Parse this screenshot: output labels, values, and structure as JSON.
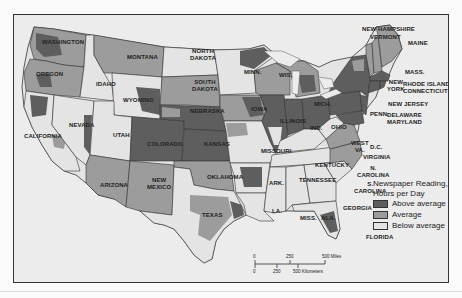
{
  "map": {
    "subject": "Newspaper reading in the United States",
    "states": [
      {
        "name": "WASHINGTON",
        "shade": "mixed"
      },
      {
        "name": "OREGON",
        "shade": "mixed"
      },
      {
        "name": "CALIFORNIA",
        "shade": "mixed"
      },
      {
        "name": "IDAHO",
        "shade": "below"
      },
      {
        "name": "NEVADA",
        "shade": "below"
      },
      {
        "name": "MONTANA",
        "shade": "average"
      },
      {
        "name": "WYOMING",
        "shade": "mixed"
      },
      {
        "name": "UTAH",
        "shade": "below"
      },
      {
        "name": "ARIZONA",
        "shade": "average"
      },
      {
        "name": "COLORADO",
        "shade": "above"
      },
      {
        "name": "NEW MEXICO",
        "shade": "average"
      },
      {
        "name": "NORTH DAKOTA",
        "shade": "below"
      },
      {
        "name": "SOUTH DAKOTA",
        "shade": "average"
      },
      {
        "name": "NEBRASKA",
        "shade": "above"
      },
      {
        "name": "KANSAS",
        "shade": "above"
      },
      {
        "name": "OKLAHOMA",
        "shade": "average"
      },
      {
        "name": "TEXAS",
        "shade": "mixed"
      },
      {
        "name": "MINN.",
        "shade": "mixed"
      },
      {
        "name": "IOWA",
        "shade": "mixed"
      },
      {
        "name": "MISSOURI",
        "shade": "below"
      },
      {
        "name": "ARK.",
        "shade": "above"
      },
      {
        "name": "LA.",
        "shade": "below"
      },
      {
        "name": "WIS.",
        "shade": "mixed"
      },
      {
        "name": "ILLINOIS",
        "shade": "above"
      },
      {
        "name": "MISS.",
        "shade": "below"
      },
      {
        "name": "MICH.",
        "shade": "mixed"
      },
      {
        "name": "IND.",
        "shade": "above"
      },
      {
        "name": "KENTUCKY",
        "shade": "below"
      },
      {
        "name": "TENNESSEE",
        "shade": "below"
      },
      {
        "name": "ALA.",
        "shade": "below"
      },
      {
        "name": "OHIO",
        "shade": "above"
      },
      {
        "name": "WEST VA.",
        "shade": "below"
      },
      {
        "name": "GEORGIA",
        "shade": "below"
      },
      {
        "name": "FLORIDA",
        "shade": "mixed"
      },
      {
        "name": "PENN.",
        "shade": "above"
      },
      {
        "name": "VIRGINIA",
        "shade": "average"
      },
      {
        "name": "N. CAROLINA",
        "shade": "average"
      },
      {
        "name": "S. CAROLINA",
        "shade": "below"
      },
      {
        "name": "NEW YORK",
        "shade": "above"
      },
      {
        "name": "NEW HAMPSHIRE",
        "shade": "average"
      },
      {
        "name": "VERMONT",
        "shade": "average"
      },
      {
        "name": "MAINE",
        "shade": "average"
      },
      {
        "name": "MASS.",
        "shade": "above"
      },
      {
        "name": "RHODE ISLAND",
        "shade": "above"
      },
      {
        "name": "CONNECTICUT",
        "shade": "above"
      },
      {
        "name": "NEW JERSEY",
        "shade": "above"
      },
      {
        "name": "DELAWARE",
        "shade": "above"
      },
      {
        "name": "MARYLAND",
        "shade": "above"
      },
      {
        "name": "D.C.",
        "shade": "above"
      }
    ],
    "labels": {
      "washington": "WASHINGTON",
      "oregon": "OREGON",
      "california": "CALIFORNIA",
      "idaho": "IDAHO",
      "nevada": "NEVADA",
      "montana": "MONTANA",
      "wyoming": "WYOMING",
      "utah": "UTAH",
      "arizona": "ARIZONA",
      "colorado": "COLORADO",
      "new_mexico_1": "NEW",
      "new_mexico_2": "MEXICO",
      "north_dakota_1": "NORTH",
      "north_dakota_2": "DAKOTA",
      "south_dakota_1": "SOUTH",
      "south_dakota_2": "DAKOTA",
      "nebraska": "NEBRASKA",
      "kansas": "KANSAS",
      "oklahoma": "OKLAHOMA",
      "texas": "TEXAS",
      "minn": "MINN.",
      "iowa": "IOWA",
      "missouri": "MISSOURI",
      "ark": "ARK.",
      "la": "LA.",
      "wis": "WIS.",
      "illinois": "ILLINOIS",
      "miss": "MISS.",
      "mich": "MICH.",
      "ind": "IND.",
      "kentucky": "KENTUCKY",
      "tennessee": "TENNESSEE",
      "ala": "ALA.",
      "ohio": "OHIO",
      "west_va_1": "WEST",
      "west_va_2": "VA.",
      "georgia": "GEORGIA",
      "florida": "FLORIDA",
      "penn": "PENN.",
      "virginia": "VIRGINIA",
      "dc": "D.C.",
      "n_carolina_1": "N.",
      "n_carolina_2": "CAROLINA",
      "s_carolina_1": "S.",
      "s_carolina_2": "CAROLINA",
      "new_york_1": "NEW",
      "new_york_2": "YORK",
      "new_hampshire": "NEW HAMPSHIRE",
      "vermont": "VERMONT",
      "maine": "MAINE",
      "mass": "MASS.",
      "rhode_island": "RHODE ISLAND",
      "connecticut": "CONNECTICUT",
      "new_jersey": "NEW JERSEY",
      "delaware": "DELAWARE",
      "maryland": "MARYLAND"
    }
  },
  "legend": {
    "title_line1": "Newspaper Reading,",
    "title_line2": "Hours per Day",
    "items": [
      {
        "label": "Above average",
        "color": "#5e5e5e"
      },
      {
        "label": "Average",
        "color": "#9c9c9c"
      },
      {
        "label": "Below average",
        "color": "#e4e4e4"
      }
    ]
  },
  "scale_bar": {
    "miles_ticks": [
      "0",
      "250",
      "500 Miles"
    ],
    "km_ticks": [
      "0",
      "250",
      "500 Kilometers"
    ]
  },
  "colors": {
    "above": "#5e5e5e",
    "average": "#9c9c9c",
    "below": "#e4e4e4",
    "water": "#ececec",
    "border": "#222222"
  }
}
